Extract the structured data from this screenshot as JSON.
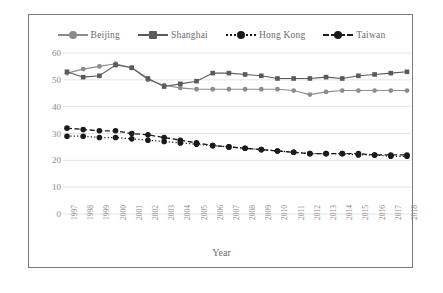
{
  "chart_data": {
    "type": "line",
    "title": "",
    "xlabel": "Year",
    "ylabel": "",
    "ylim": [
      0,
      60
    ],
    "yticks": [
      0,
      10,
      20,
      30,
      40,
      50,
      60
    ],
    "grid": true,
    "legend_position": "top",
    "categories": [
      1997,
      1998,
      1999,
      2000,
      2001,
      2002,
      2003,
      2004,
      2005,
      2006,
      2007,
      2008,
      2009,
      2010,
      2011,
      2012,
      2013,
      2014,
      2015,
      2016,
      2017,
      2018
    ],
    "x": [
      "1997",
      "1998",
      "1999",
      "2000",
      "2001",
      "2002",
      "2003",
      "2004",
      "2005",
      "2006",
      "2007",
      "2008",
      "2009",
      "2010",
      "2011",
      "2012",
      "2013",
      "2014",
      "2015",
      "2016",
      "2017",
      "2018"
    ],
    "series": [
      {
        "name": "Beijing",
        "color": "#8c8c8c",
        "line_style": "solid",
        "marker": "circle",
        "values": [
          52.5,
          54.0,
          55.0,
          56.0,
          54.5,
          50.0,
          48.0,
          47.0,
          46.5,
          46.5,
          46.5,
          46.5,
          46.5,
          46.5,
          46.0,
          44.5,
          45.5,
          46.0,
          46.0,
          46.0,
          46.0,
          46.0
        ]
      },
      {
        "name": "Shanghai",
        "color": "#5a5a5a",
        "line_style": "solid",
        "marker": "square",
        "values": [
          53.0,
          51.0,
          51.5,
          55.5,
          54.5,
          50.5,
          47.5,
          48.5,
          49.5,
          52.5,
          52.5,
          52.0,
          51.5,
          50.5,
          50.5,
          50.5,
          51.0,
          50.5,
          51.5,
          52.0,
          52.5,
          53.0
        ]
      },
      {
        "name": "Hong Kong",
        "color": "#1a1a1a",
        "line_style": "dotted",
        "marker": "circle",
        "values": [
          29.0,
          29.0,
          28.5,
          28.5,
          28.0,
          27.5,
          27.0,
          26.5,
          26.0,
          25.5,
          25.0,
          24.5,
          24.0,
          23.5,
          23.0,
          22.5,
          22.5,
          22.5,
          22.0,
          22.0,
          21.5,
          21.5
        ]
      },
      {
        "name": "Taiwan",
        "color": "#1a1a1a",
        "line_style": "dashed",
        "marker": "circle",
        "values": [
          32.0,
          31.5,
          31.0,
          31.0,
          30.0,
          29.5,
          28.5,
          27.5,
          26.5,
          25.5,
          25.0,
          24.5,
          24.0,
          23.5,
          23.0,
          22.5,
          22.5,
          22.5,
          22.5,
          22.0,
          22.0,
          22.0
        ]
      }
    ]
  },
  "legend": {
    "items": [
      {
        "label": "Beijing"
      },
      {
        "label": "Shanghai"
      },
      {
        "label": "Hong Kong"
      },
      {
        "label": "Taiwan"
      }
    ]
  },
  "axes": {
    "x_title": "Year"
  }
}
